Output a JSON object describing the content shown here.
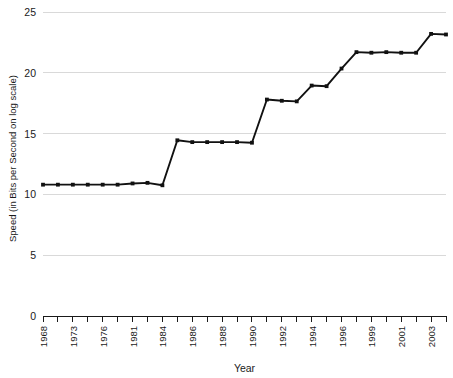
{
  "chart_data": {
    "type": "line",
    "title": "",
    "subtitle": "",
    "xlabel": "Year",
    "ylabel": "Speed (in Bits per Second on log scale)",
    "ylim": [
      0,
      25
    ],
    "xlim": [
      1968,
      2004
    ],
    "grid": true,
    "legend": null,
    "legend_position": "none",
    "y_ticks": [
      0,
      5,
      10,
      15,
      20,
      25
    ],
    "y_tick_labels": [
      "0",
      "5",
      "10",
      "15",
      "20",
      "25"
    ],
    "x_tick_labels": [
      "1968",
      "",
      "1973",
      "",
      "1976",
      "",
      "1981",
      "",
      "1984",
      "",
      "1986",
      "",
      "1988",
      "",
      "1990",
      "",
      "1992",
      "",
      "1994",
      "",
      "1996",
      "",
      "1999",
      "",
      "2001",
      "",
      "2003",
      ""
    ],
    "x_labeled_ticks": [
      "1968",
      "1973",
      "1976",
      "1981",
      "1984",
      "1986",
      "1988",
      "1990",
      "1992",
      "1994",
      "1996",
      "1999",
      "2001",
      "2003"
    ],
    "marker": "square",
    "line_color": "#111111",
    "grid_color": "#d9d9d9",
    "series": [
      {
        "name": "Modem / network speed",
        "x": [
          1968,
          1971,
          1973,
          1975,
          1976,
          1979,
          1981,
          1983,
          1984,
          1985,
          1986,
          1987,
          1988,
          1989,
          1990,
          1991,
          1992,
          1993,
          1994,
          1995,
          1996,
          1997,
          1999,
          2000,
          2001,
          2002,
          2003,
          2004
        ],
        "values": [
          10.8,
          10.8,
          10.8,
          10.8,
          10.8,
          10.8,
          10.9,
          10.95,
          10.75,
          14.45,
          14.3,
          14.3,
          14.3,
          14.3,
          14.25,
          17.8,
          17.7,
          17.65,
          18.95,
          18.9,
          20.35,
          21.7,
          21.65,
          21.7,
          21.65,
          21.65,
          23.2,
          23.15
        ]
      }
    ]
  },
  "axes": {
    "y_axis_label": "Speed (in Bits per Second on log scale)",
    "x_axis_label": "Year"
  }
}
